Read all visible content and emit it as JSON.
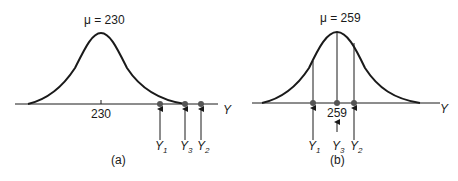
{
  "figure": {
    "colors": {
      "ink": "#1a1a1a",
      "point": "#555555",
      "background": "#ffffff"
    },
    "panels": [
      {
        "id": "a",
        "caption": "(a)",
        "mean_label": "μ = 230",
        "tick_label": "230",
        "axis_label": "Y",
        "points": [
          {
            "name": "Y",
            "sub": "1"
          },
          {
            "name": "Y",
            "sub": "3"
          },
          {
            "name": "Y",
            "sub": "2"
          }
        ]
      },
      {
        "id": "b",
        "caption": "(b)",
        "mean_label": "μ = 259",
        "tick_label": "259",
        "axis_label": "Y",
        "points": [
          {
            "name": "Y",
            "sub": "1"
          },
          {
            "name": "Y",
            "sub": "3"
          },
          {
            "name": "Y",
            "sub": "2"
          }
        ]
      }
    ]
  }
}
